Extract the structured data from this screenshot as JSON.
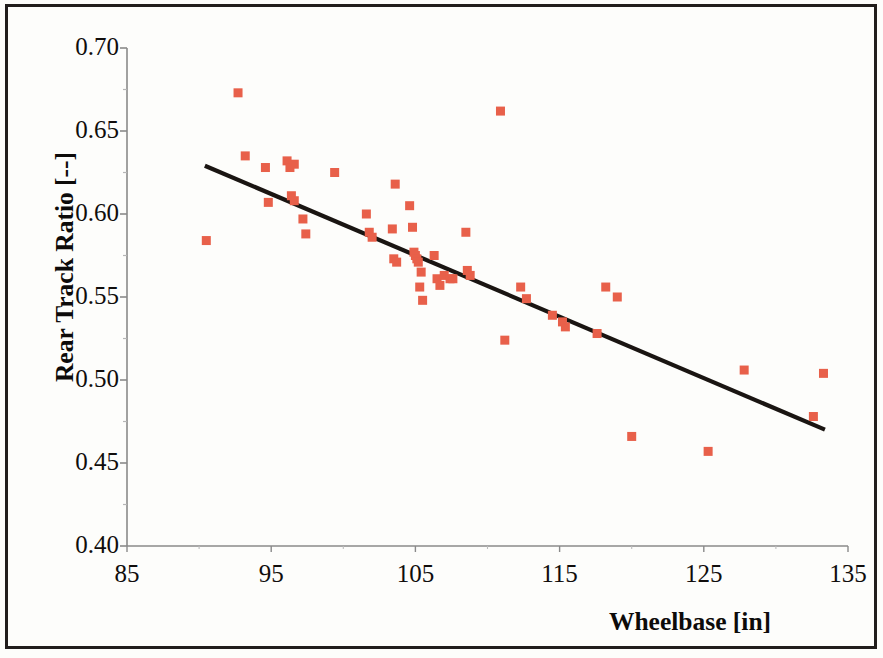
{
  "chart_data": {
    "type": "scatter",
    "title": "",
    "xlabel": "Wheelbase  [in]",
    "ylabel": "Rear Track Ratio [--]",
    "xlim": [
      85,
      135
    ],
    "ylim": [
      0.4,
      0.7
    ],
    "xticks": [
      85,
      95,
      105,
      115,
      125,
      135
    ],
    "xtick_labels": [
      "85",
      "95",
      "105",
      "115",
      "125",
      "135"
    ],
    "yticks": [
      0.4,
      0.45,
      0.5,
      0.55,
      0.6,
      0.65,
      0.7
    ],
    "ytick_labels": [
      "0.40",
      "0.45",
      "0.50",
      "0.55",
      "0.60",
      "0.65",
      "0.70"
    ],
    "x_minor_ticks": [
      90,
      100,
      110,
      120,
      130
    ],
    "y_minor_ticks": [
      0.425,
      0.475,
      0.525,
      0.575,
      0.625,
      0.675
    ],
    "grid": false,
    "legend": null,
    "marker_color": "#e8604a",
    "marker_shape": "square",
    "marker_size_px": 9,
    "axis_color": "#8a8a8a",
    "text_color": "#100d0c",
    "series": [
      {
        "name": "Vehicles",
        "type": "scatter",
        "points": [
          [
            90.5,
            0.584
          ],
          [
            92.7,
            0.673
          ],
          [
            93.2,
            0.635
          ],
          [
            94.6,
            0.628
          ],
          [
            94.8,
            0.607
          ],
          [
            96.1,
            0.632
          ],
          [
            96.3,
            0.628
          ],
          [
            96.6,
            0.63
          ],
          [
            96.4,
            0.611
          ],
          [
            96.6,
            0.608
          ],
          [
            97.2,
            0.597
          ],
          [
            97.4,
            0.588
          ],
          [
            99.4,
            0.625
          ],
          [
            101.6,
            0.6
          ],
          [
            101.8,
            0.589
          ],
          [
            102.0,
            0.586
          ],
          [
            103.6,
            0.618
          ],
          [
            103.4,
            0.591
          ],
          [
            103.5,
            0.573
          ],
          [
            103.7,
            0.571
          ],
          [
            104.6,
            0.605
          ],
          [
            104.8,
            0.592
          ],
          [
            104.9,
            0.577
          ],
          [
            105.0,
            0.575
          ],
          [
            105.1,
            0.573
          ],
          [
            105.2,
            0.571
          ],
          [
            105.4,
            0.565
          ],
          [
            105.3,
            0.556
          ],
          [
            105.5,
            0.548
          ],
          [
            106.3,
            0.575
          ],
          [
            106.5,
            0.561
          ],
          [
            106.7,
            0.557
          ],
          [
            107.0,
            0.563
          ],
          [
            107.4,
            0.561
          ],
          [
            107.6,
            0.561
          ],
          [
            108.5,
            0.589
          ],
          [
            108.6,
            0.566
          ],
          [
            108.8,
            0.563
          ],
          [
            110.9,
            0.662
          ],
          [
            111.2,
            0.524
          ],
          [
            112.3,
            0.556
          ],
          [
            112.7,
            0.549
          ],
          [
            114.5,
            0.539
          ],
          [
            115.2,
            0.535
          ],
          [
            115.4,
            0.532
          ],
          [
            117.6,
            0.528
          ],
          [
            118.2,
            0.556
          ],
          [
            119.0,
            0.55
          ],
          [
            120.0,
            0.466
          ],
          [
            125.3,
            0.457
          ],
          [
            127.8,
            0.506
          ],
          [
            132.6,
            0.478
          ],
          [
            133.3,
            0.504
          ]
        ]
      },
      {
        "name": "Linear trend",
        "type": "line",
        "color": "#1a1512",
        "points": [
          [
            90.4,
            0.6291
          ],
          [
            133.4,
            0.4701
          ]
        ]
      }
    ]
  },
  "axes": {
    "x_axis_name": "wheelbase-axis",
    "y_axis_name": "rear-track-ratio-axis"
  }
}
